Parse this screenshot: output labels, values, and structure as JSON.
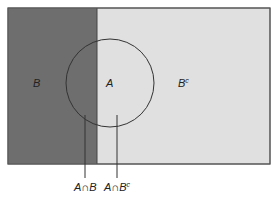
{
  "diagram": {
    "type": "venn",
    "regions": {
      "B": {
        "label": "B",
        "color": "#6e6e6e"
      },
      "Bc": {
        "label": "B",
        "sup": "c",
        "color": "#e0e0e0"
      },
      "A": {
        "label": "A"
      }
    },
    "callouts": [
      {
        "label": "A∩B"
      },
      {
        "label": "A∩B",
        "sup": "c"
      }
    ],
    "colors": {
      "border": "#555555",
      "circle": "#333333",
      "text": "#222222"
    }
  }
}
